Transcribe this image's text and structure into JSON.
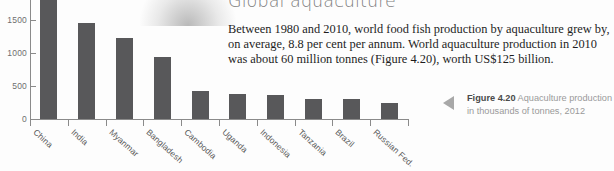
{
  "page": {
    "heading": "Global aquaculture",
    "body_text": "Between 1980 and 2010, world food fish production by aquaculture grew by, on average, 8.8 per cent per annum. World aquaculture production in 2010 was about 60 million tonnes (Figure 4.20), worth US$125 billion."
  },
  "figure_caption": {
    "label": "Figure 4.20",
    "text": " Aquaculture production in thousands of tonnes, 2012",
    "marker_icon": "left-pointing-triangle-icon"
  },
  "colors": {
    "bar": "#58585a",
    "axis": "#8a8a8a",
    "heading": "#7d7d7d",
    "caption": "#9a9a9a",
    "body": "#1d1d1d",
    "background": "#fdfdfd"
  },
  "chart_data": {
    "type": "bar",
    "title": "",
    "xlabel": "",
    "ylabel": "",
    "ylim": [
      0,
      1800
    ],
    "yticks": [
      0,
      500,
      1000,
      1500
    ],
    "ytick_labels": [
      "0",
      "500",
      "1000",
      "1500"
    ],
    "grid": false,
    "legend": "none",
    "categories": [
      "China",
      "India",
      "Myanmar",
      "Bangladesh",
      "Cambodia",
      "Uganda",
      "Indonesia",
      "Tanzania",
      "Brazil",
      "Russian Fed."
    ],
    "values": [
      1800,
      1450,
      1230,
      940,
      430,
      380,
      360,
      310,
      300,
      240
    ],
    "units": "thousands of tonnes",
    "note": "China bar is clipped by the top edge of the figure"
  }
}
